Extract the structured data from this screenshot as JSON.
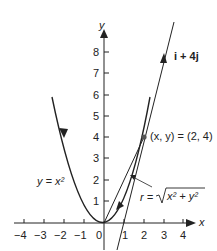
{
  "figure": {
    "curve_label": "y = x²",
    "point_label": "(x, y) = (2, 4)",
    "vector_label": "i + 4j",
    "r_label_prefix": "r = ",
    "r_label_radicand": "x² + y²",
    "x_axis_label": "x",
    "y_axis_label": "y",
    "x_ticks": [
      "−4",
      "−3",
      "−2",
      "−1",
      "0",
      "1",
      "2",
      "3",
      "4"
    ],
    "y_ticks": [
      "1",
      "2",
      "3",
      "4",
      "5",
      "6",
      "7",
      "8"
    ],
    "colors": {
      "ink": "#222222",
      "point": "#555555"
    }
  }
}
